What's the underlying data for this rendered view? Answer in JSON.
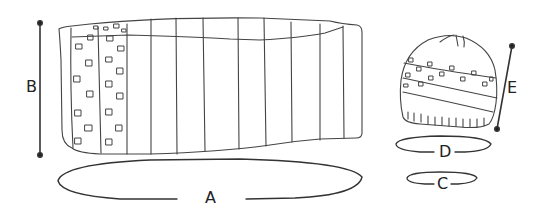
{
  "diagram": {
    "type": "knitting-schematic",
    "colors": {
      "stroke": "#444444",
      "text": "#222222",
      "background": "#ffffff"
    },
    "cowl": {
      "name": "cowl",
      "labels": {
        "width": "A",
        "height": "B"
      }
    },
    "hat": {
      "name": "hat",
      "labels": {
        "length": "E",
        "circumference_top": "D",
        "circumference_brim": "C"
      }
    }
  }
}
